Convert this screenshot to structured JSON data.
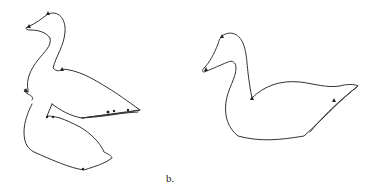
{
  "figure": {
    "caption_b": "b.",
    "stroke_color": "#333333",
    "background": "#ffffff"
  },
  "panels": [
    {
      "id": "a",
      "description": "Duck outline decomposed into overlapping parts (head/neck, body, lower body) with control point markers"
    },
    {
      "id": "b",
      "description": "Single continuous duck outline with sparse control point markers"
    }
  ]
}
